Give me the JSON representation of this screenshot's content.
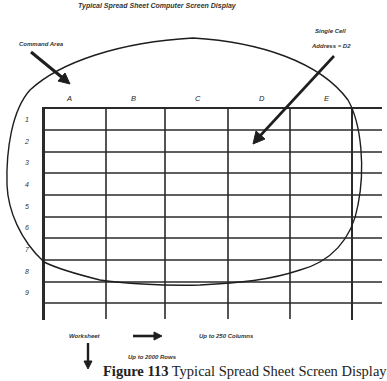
{
  "diagram": {
    "title": "Typical Spread Sheet Computer Screen Display",
    "annotations": {
      "command_area": "Command Area",
      "single_cell_line1": "Single Cell",
      "single_cell_line2": "Address = D2",
      "worksheet": "Worksheet",
      "columns_note": "Up to 250 Columns",
      "rows_note": "Up to 2000 Rows"
    },
    "columns": [
      "A",
      "B",
      "C",
      "D",
      "E"
    ],
    "rows": [
      "1",
      "2",
      "3",
      "4",
      "5",
      "6",
      "7",
      "8",
      "9"
    ],
    "caption": {
      "label": "Figure 113",
      "text": " Typical Spread Sheet Screen Display"
    }
  }
}
